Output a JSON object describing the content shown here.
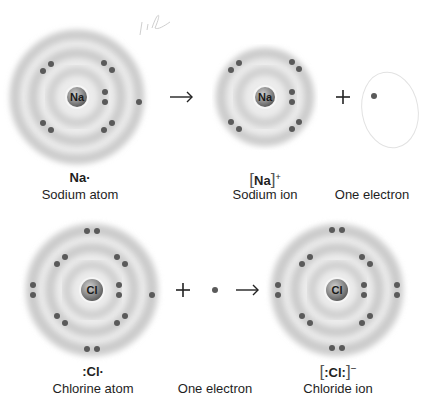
{
  "colors": {
    "background": "#ffffff",
    "shell": "#cfcfcf",
    "electron": "#5a5a5a",
    "nucleus": "#8a8a8a",
    "text": "#1e1e1e",
    "handwriting": "#d8d8d8"
  },
  "top_row": {
    "sodium_atom": {
      "nucleus_symbol": "Na",
      "formula": "Na·",
      "label": "Sodium atom",
      "shells": [
        2,
        8,
        1
      ]
    },
    "arrow": "→",
    "sodium_ion": {
      "nucleus_symbol": "Na",
      "formula_bracket_content": "Na",
      "formula_charge": "+",
      "label": "Sodium ion",
      "shells": [
        2,
        8
      ]
    },
    "plus": "+",
    "electron": {
      "label": "One electron"
    },
    "handwritten_note": "1l"
  },
  "bottom_row": {
    "chlorine_atom": {
      "nucleus_symbol": "Cl",
      "formula": ":Cl·",
      "label": "Chlorine atom",
      "shells": [
        2,
        8,
        7
      ]
    },
    "plus": "+",
    "electron": {
      "label": "One electron"
    },
    "arrow": "→",
    "chloride_ion": {
      "nucleus_symbol": "Cl",
      "formula_bracket_content": ":Cl:",
      "formula_charge": "−",
      "label": "Chloride ion",
      "shells": [
        2,
        8,
        8
      ]
    }
  }
}
